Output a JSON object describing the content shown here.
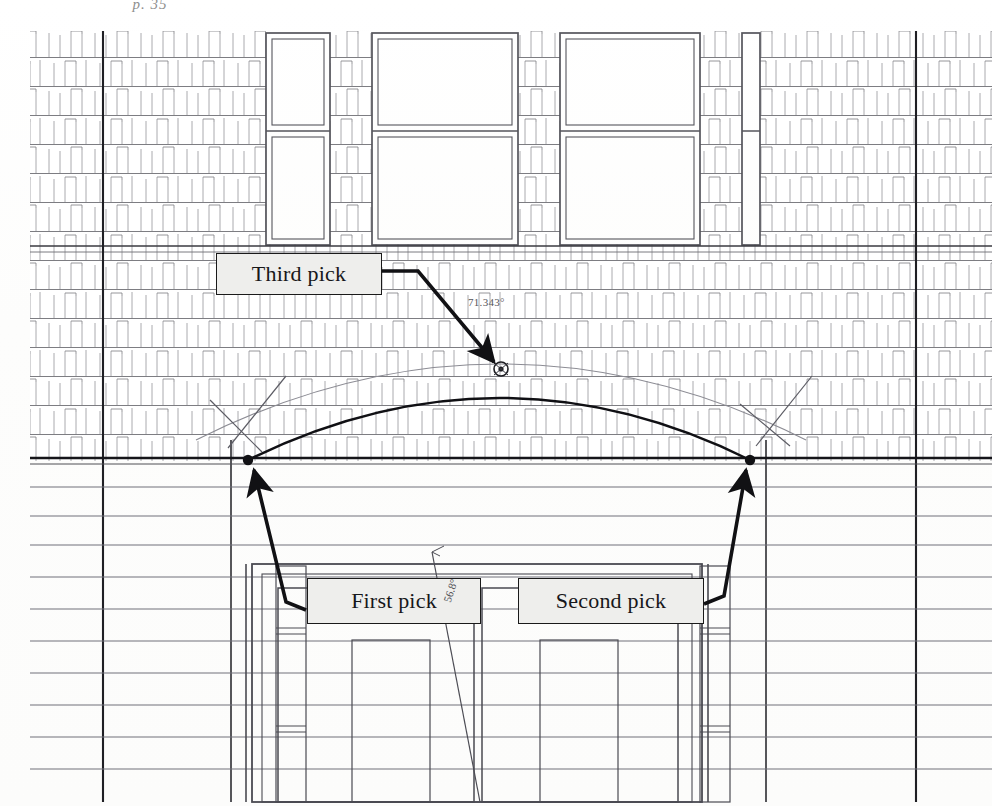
{
  "document": {
    "header_caption": "p. 35",
    "type": "architectural-elevation-drawing",
    "description": "Brick facade elevation with three-point arc construction"
  },
  "callouts": [
    {
      "id": "third",
      "label": "Third pick"
    },
    {
      "id": "first",
      "label": "First pick"
    },
    {
      "id": "second",
      "label": "Second pick"
    }
  ],
  "annotations": {
    "arc_angle": "71.343°",
    "leader_angle": "56.8°"
  },
  "icons": {
    "arrow": "arrow-pointer-icon",
    "vertex": "vertex-node-icon"
  },
  "colors": {
    "ink": "#1a1a1a",
    "light_ink": "#8a8a90",
    "callout_fill": "#eeeeec",
    "paper": "#ffffff"
  },
  "geometry": {
    "pick_points": [
      {
        "name": "first-pick-point",
        "x": 248,
        "y": 460
      },
      {
        "name": "second-pick-point",
        "x": 750,
        "y": 460
      },
      {
        "name": "third-pick-point",
        "x": 500,
        "y": 369
      }
    ],
    "belt_course_y": 459,
    "arc_span": 502
  }
}
